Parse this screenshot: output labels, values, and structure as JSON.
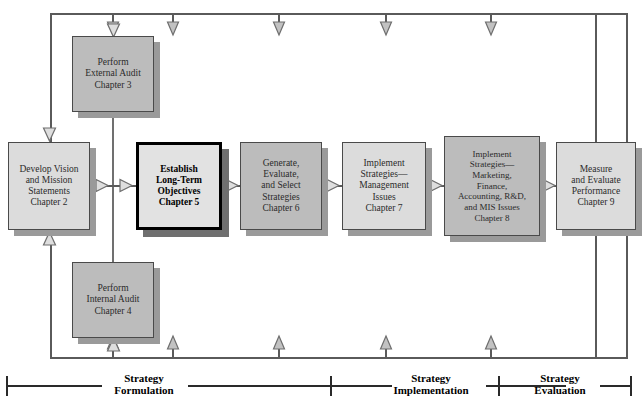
{
  "diagram": {
    "colors": {
      "box_fill_dark": "#bcbcbc",
      "box_fill_light": "#dcdcdc",
      "box_fill_emphasis": "#e2e2e2",
      "box_border": "#4a4a4a",
      "box_border_emphasis": "#000000",
      "shadow": "#9a9a9a",
      "connector": "#5a5a5a",
      "arrow_fill": "#b9b9b9",
      "phase_rule": "#2a2a2a",
      "text": "#2b2b2b",
      "background": "#ffffff"
    },
    "nodes": [
      {
        "id": "external-audit",
        "label": "Perform\nExternal Audit\nChapter 3",
        "chapter": "Chapter 3",
        "shade": "dark",
        "emphasis": false,
        "x": 72,
        "y": 36,
        "w": 82,
        "h": 76
      },
      {
        "id": "vision-mission",
        "label": "Develop Vision\nand Mission\nStatements\nChapter 2",
        "chapter": "Chapter 2",
        "shade": "light",
        "emphasis": false,
        "x": 8,
        "y": 142,
        "w": 82,
        "h": 88
      },
      {
        "id": "long-term-objectives",
        "label": "Establish\nLong-Term\nObjectives\nChapter 5",
        "chapter": "Chapter 5",
        "shade": "emphasis",
        "emphasis": true,
        "x": 136,
        "y": 142,
        "w": 86,
        "h": 88
      },
      {
        "id": "generate-select-strategies",
        "label": "Generate,\nEvaluate,\nand Select\nStrategies\nChapter 6",
        "chapter": "Chapter 6",
        "shade": "dark",
        "emphasis": false,
        "x": 240,
        "y": 142,
        "w": 82,
        "h": 88
      },
      {
        "id": "implement-management",
        "label": "Implement\nStrategies—\nManagement\nIssues\nChapter 7",
        "chapter": "Chapter 7",
        "shade": "light",
        "emphasis": false,
        "x": 342,
        "y": 142,
        "w": 84,
        "h": 88
      },
      {
        "id": "implement-functional",
        "label": "Implement\nStrategies—\nMarketing,\nFinance,\nAccounting, R&D,\nand MIS Issues\nChapter 8",
        "chapter": "Chapter 8",
        "shade": "dark",
        "emphasis": false,
        "x": 444,
        "y": 136,
        "w": 96,
        "h": 100
      },
      {
        "id": "measure-evaluate",
        "label": "Measure\nand Evaluate\nPerformance\nChapter 9",
        "chapter": "Chapter 9",
        "shade": "light",
        "emphasis": false,
        "x": 556,
        "y": 142,
        "w": 80,
        "h": 88
      },
      {
        "id": "internal-audit",
        "label": "Perform\nInternal Audit\nChapter 4",
        "chapter": "Chapter 4",
        "shade": "dark",
        "emphasis": false,
        "x": 72,
        "y": 262,
        "w": 82,
        "h": 76
      }
    ],
    "phases": [
      {
        "id": "strategy-formulation",
        "label": "Strategy\nFormulation"
      },
      {
        "id": "strategy-implementation",
        "label": "Strategy\nImplementation"
      },
      {
        "id": "strategy-evaluation",
        "label": "Strategy\nEvaluation"
      }
    ],
    "feedback": {
      "top_loop_name": "feedback-loop-top",
      "bottom_loop_name": "feedback-loop-bottom"
    }
  }
}
